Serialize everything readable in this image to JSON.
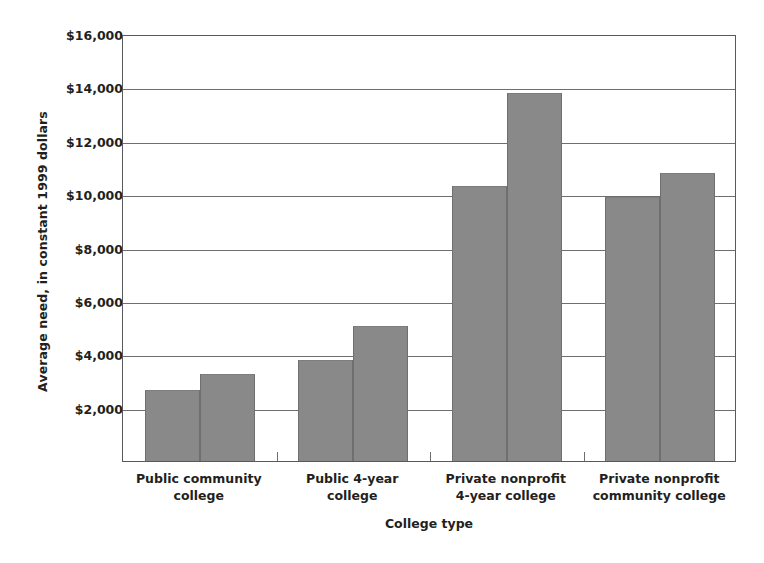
{
  "chart_data": {
    "type": "bar",
    "title": "",
    "xlabel": "College type",
    "ylabel": "Average need, in constant 1999 dollars",
    "categories": [
      "Public community\ncollege",
      "Public 4-year\ncollege",
      "Private nonprofit\n4-year college",
      "Private nonprofit\ncommunity college"
    ],
    "series": [
      {
        "name": "Series 1",
        "values": [
          2670,
          3800,
          10300,
          9900
        ]
      },
      {
        "name": "Series 2",
        "values": [
          3270,
          5050,
          13800,
          10800
        ]
      }
    ],
    "ylim": [
      0,
      16000
    ],
    "ytick_values": [
      2000,
      4000,
      6000,
      8000,
      10000,
      12000,
      14000,
      16000
    ],
    "ytick_labels": [
      "$2,000",
      "$4,000",
      "$6,000",
      "$8,000",
      "$10,000",
      "$12,000",
      "$14,000",
      "$16,000"
    ],
    "grid": true,
    "legend": "none",
    "bar_color": "#898989",
    "axis_color": "#58595b",
    "grid_color": "#6d6e71",
    "text_color": "#231f20"
  },
  "axis": {
    "x_title": "College type",
    "y_title": "Average need, in constant 1999 dollars"
  }
}
